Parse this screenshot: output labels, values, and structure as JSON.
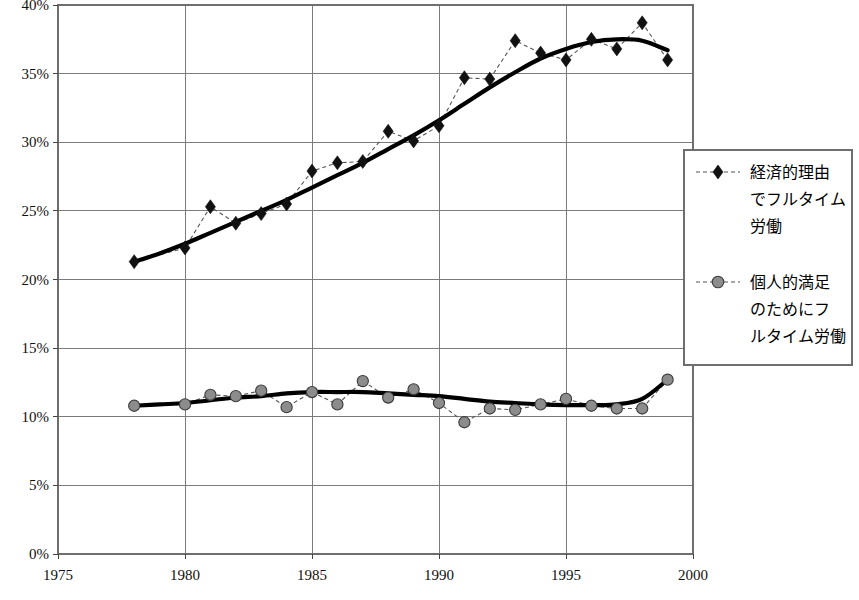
{
  "chart_data": {
    "type": "line",
    "title": "",
    "xlabel": "",
    "ylabel": "",
    "xlim": [
      1975,
      2000
    ],
    "ylim": [
      0,
      40
    ],
    "grid": true,
    "legend_position": "right",
    "x_tick_labels": [
      "1975",
      "1980",
      "1985",
      "1990",
      "1995",
      "2000"
    ],
    "x_ticks": [
      1975,
      1980,
      1985,
      1990,
      1995,
      2000
    ],
    "y_tick_labels": [
      "0%",
      "5%",
      "10%",
      "15%",
      "20%",
      "25%",
      "30%",
      "35%",
      "40%"
    ],
    "y_ticks": [
      0,
      5,
      10,
      15,
      20,
      25,
      30,
      35,
      40
    ],
    "x": [
      1978,
      1979,
      1980,
      1981,
      1982,
      1983,
      1984,
      1985,
      1986,
      1987,
      1988,
      1989,
      1990,
      1991,
      1992,
      1993,
      1994,
      1995,
      1996,
      1997,
      1998,
      1999
    ],
    "series": [
      {
        "name": "経済的理由でフルタイム労働",
        "marker": "diamond",
        "color": "#111111",
        "values": [
          21.3,
          null,
          22.3,
          25.3,
          24.1,
          24.8,
          25.5,
          27.9,
          28.5,
          28.6,
          30.8,
          30.1,
          31.2,
          34.7,
          34.6,
          37.4,
          36.5,
          36.0,
          37.5,
          36.8,
          38.7,
          36.0
        ],
        "trend": [
          21.3,
          21.9,
          22.6,
          23.4,
          24.2,
          25.0,
          25.8,
          26.7,
          27.6,
          28.5,
          29.5,
          30.5,
          31.6,
          32.8,
          34.0,
          35.1,
          36.1,
          36.8,
          37.3,
          37.5,
          37.4,
          36.7
        ]
      },
      {
        "name": "個人的満足のためにフルタイム労働",
        "marker": "circle",
        "color": "#8c8c8c",
        "values": [
          10.8,
          null,
          10.9,
          11.6,
          11.5,
          11.9,
          10.7,
          11.8,
          10.9,
          12.6,
          11.4,
          12.0,
          11.0,
          9.6,
          10.6,
          10.5,
          10.9,
          11.3,
          10.8,
          10.6,
          10.6,
          12.7
        ],
        "trend": [
          10.8,
          10.9,
          11.0,
          11.2,
          11.4,
          11.5,
          11.7,
          11.8,
          11.8,
          11.8,
          11.7,
          11.6,
          11.5,
          11.3,
          11.1,
          11.0,
          10.9,
          10.85,
          10.85,
          10.9,
          11.3,
          12.7
        ]
      }
    ]
  },
  "legend": {
    "entries": [
      {
        "label_lines": [
          "経済的理由",
          "でフルタイム",
          "労働"
        ],
        "marker": "diamond"
      },
      {
        "label_lines": [
          "個人的満足",
          "のためにフ",
          "ルタイム労働"
        ],
        "marker": "circle"
      }
    ]
  }
}
